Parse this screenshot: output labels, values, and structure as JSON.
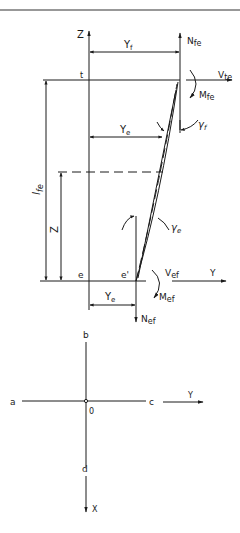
{
  "figure": {
    "upper_diagram": {
      "axis_z_label": "Z",
      "axis_y_label": "Y",
      "top_node_label": "t",
      "bottom_node_label": "e",
      "bottom_node_deflected_label": "e'",
      "dim_yf": "Y",
      "dim_yf_sub": "f",
      "dim_ye_upper": "Y",
      "dim_ye_upper_sub": "e",
      "dim_ye_lower": "Y",
      "dim_ye_lower_sub": "e",
      "dim_lfe": "l",
      "dim_lfe_sub": "fe",
      "dim_z": "Z",
      "force_nfe": "N",
      "force_nfe_sub": "fe",
      "force_vfe": "V",
      "force_vfe_sub": "te",
      "moment_mfe": "M",
      "moment_mfe_sub": "fe",
      "rotation_gamma_f": "γ",
      "rotation_gamma_f_sub": "f",
      "rotation_gamma_e": "γ",
      "rotation_gamma_e_sub": "e",
      "force_vef": "V",
      "force_vef_sub": "ef",
      "moment_mef": "M",
      "moment_mef_sub": "ef",
      "force_nef": "N",
      "force_nef_sub": "ef"
    },
    "lower_diagram": {
      "label_a": "a",
      "label_b": "b",
      "label_c": "c",
      "label_d": "d",
      "origin_label": "0",
      "axis_y_label": "Y",
      "axis_x_label": "X"
    },
    "colors": {
      "ink": "#1a1a1a",
      "background": "#ffffff"
    }
  }
}
